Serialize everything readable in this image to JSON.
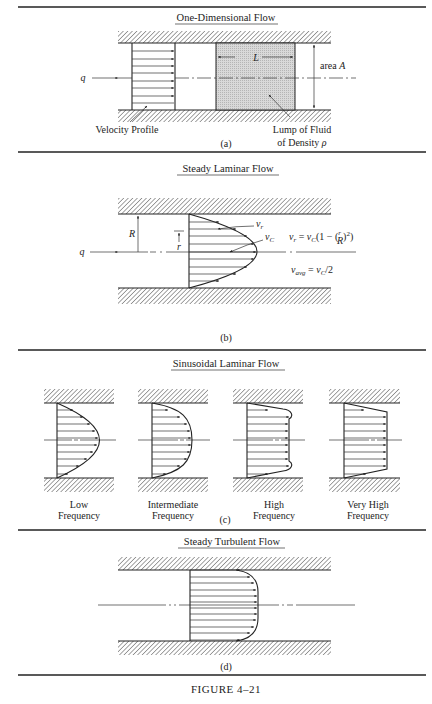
{
  "figure": {
    "caption": "Figure 4–21",
    "caption_display": "FIGURE 4–21"
  },
  "panels": {
    "a": {
      "title": "One-Dimensional Flow",
      "tag": "(a)",
      "flow_symbol": "q",
      "length_symbol": "L",
      "area_label": "area",
      "area_symbol": "A",
      "velocity_profile_label": "Velocity Profile",
      "lump_label_line1": "Lump of Fluid",
      "lump_label_line2": "of Density",
      "density_symbol": "ρ"
    },
    "b": {
      "title": "Steady Laminar Flow",
      "tag": "(b)",
      "flow_symbol": "q",
      "radius_symbol": "R",
      "r_symbol": "r",
      "vr_symbol": "v",
      "vr_sub": "r",
      "vc_symbol": "v",
      "vc_sub": "C",
      "equation1": "v_r = v_C(1 − (r/R)²)",
      "equation2": "v_avg = v_C/2",
      "eq1_parts": {
        "v": "v",
        "r": "r",
        "eq": " = ",
        "vc": "v",
        "C": "C",
        "rest1": "(1 − (",
        "frac_num": "r",
        "frac_den": "R",
        "rest2": ")",
        "sq": "2",
        "close": ")"
      },
      "eq2_parts": {
        "v": "v",
        "avg": "avg",
        "eq": " = ",
        "vc": "v",
        "C": "C",
        "rest": "/2"
      }
    },
    "c": {
      "title": "Sinusoidal Laminar Flow",
      "tag": "(c)",
      "profiles": [
        {
          "line1": "Low",
          "line2": "Frequency"
        },
        {
          "line1": "Intermediate",
          "line2": "Frequency"
        },
        {
          "line1": "High",
          "line2": "Frequency"
        },
        {
          "line1": "Very High",
          "line2": "Frequency"
        }
      ]
    },
    "d": {
      "title": "Steady Turbulent Flow",
      "tag": "(d)"
    }
  }
}
